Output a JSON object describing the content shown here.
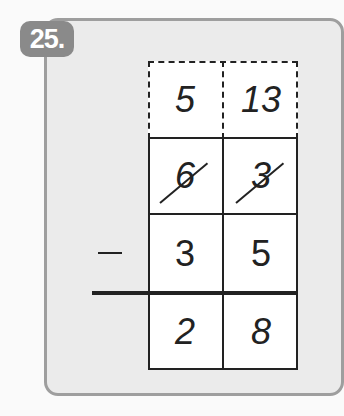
{
  "problem": {
    "number_label": "25.",
    "operation": "−",
    "borrow_row": [
      "5",
      "13"
    ],
    "minuend": [
      "6",
      "3"
    ],
    "minuend_crossed_out": [
      true,
      true
    ],
    "subtrahend": [
      "3",
      "5"
    ],
    "difference": [
      "2",
      "8"
    ]
  },
  "colors": {
    "badge": "#8a8a8a",
    "panel": "#ebebeb",
    "panel_border": "#9e9e9e",
    "ink": "#222222"
  }
}
